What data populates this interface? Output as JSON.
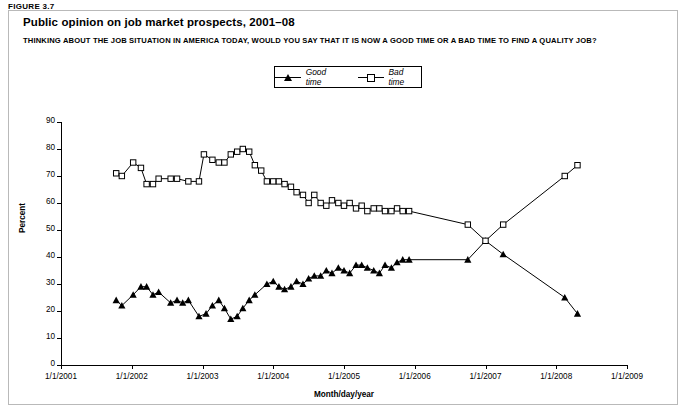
{
  "figure_label": "FIGURE 3.7",
  "title": "Public opinion on job market prospects, 2001–08",
  "subtitle": "THINKING ABOUT THE JOB SITUATION IN AMERICA TODAY, WOULD YOU SAY THAT IT IS NOW A GOOD TIME  OR A BAD TIME TO FIND A QUALITY JOB?",
  "chart_data": {
    "type": "line",
    "title": "Public opinion on job market prospects, 2001–08",
    "xlabel": "Month/day/year",
    "ylabel": "Percent",
    "ylim": [
      0,
      90
    ],
    "yticks": [
      0,
      10,
      20,
      30,
      40,
      50,
      60,
      70,
      80,
      90
    ],
    "xlim": [
      "1/1/2001",
      "1/1/2009"
    ],
    "xticks": [
      "1/1/2001",
      "1/1/2002",
      "1/1/2003",
      "1/1/2004",
      "1/1/2005",
      "1/1/2006",
      "1/1/2007",
      "1/1/2008",
      "1/1/2009"
    ],
    "grid": false,
    "legend_position": "top-center",
    "series": [
      {
        "name": "Good time",
        "marker": "filled-triangle",
        "points": [
          {
            "x": 2001.78,
            "y": 24
          },
          {
            "x": 2001.86,
            "y": 22
          },
          {
            "x": 2002.02,
            "y": 26
          },
          {
            "x": 2002.13,
            "y": 29
          },
          {
            "x": 2002.21,
            "y": 29
          },
          {
            "x": 2002.3,
            "y": 26
          },
          {
            "x": 2002.38,
            "y": 27
          },
          {
            "x": 2002.55,
            "y": 23
          },
          {
            "x": 2002.64,
            "y": 24
          },
          {
            "x": 2002.72,
            "y": 23
          },
          {
            "x": 2002.8,
            "y": 24
          },
          {
            "x": 2002.95,
            "y": 18
          },
          {
            "x": 2003.05,
            "y": 19
          },
          {
            "x": 2003.14,
            "y": 22
          },
          {
            "x": 2003.23,
            "y": 24
          },
          {
            "x": 2003.31,
            "y": 21
          },
          {
            "x": 2003.4,
            "y": 17
          },
          {
            "x": 2003.49,
            "y": 18
          },
          {
            "x": 2003.57,
            "y": 21
          },
          {
            "x": 2003.66,
            "y": 24
          },
          {
            "x": 2003.74,
            "y": 26
          },
          {
            "x": 2003.91,
            "y": 30
          },
          {
            "x": 2004.0,
            "y": 31
          },
          {
            "x": 2004.08,
            "y": 29
          },
          {
            "x": 2004.16,
            "y": 28
          },
          {
            "x": 2004.25,
            "y": 29
          },
          {
            "x": 2004.33,
            "y": 31
          },
          {
            "x": 2004.42,
            "y": 30
          },
          {
            "x": 2004.5,
            "y": 32
          },
          {
            "x": 2004.58,
            "y": 33
          },
          {
            "x": 2004.67,
            "y": 33
          },
          {
            "x": 2004.75,
            "y": 35
          },
          {
            "x": 2004.83,
            "y": 34
          },
          {
            "x": 2004.92,
            "y": 36
          },
          {
            "x": 2005.0,
            "y": 35
          },
          {
            "x": 2005.08,
            "y": 34
          },
          {
            "x": 2005.17,
            "y": 37
          },
          {
            "x": 2005.25,
            "y": 37
          },
          {
            "x": 2005.33,
            "y": 36
          },
          {
            "x": 2005.42,
            "y": 35
          },
          {
            "x": 2005.5,
            "y": 34
          },
          {
            "x": 2005.58,
            "y": 37
          },
          {
            "x": 2005.67,
            "y": 36
          },
          {
            "x": 2005.75,
            "y": 38
          },
          {
            "x": 2005.83,
            "y": 39
          },
          {
            "x": 2005.92,
            "y": 39
          },
          {
            "x": 2006.75,
            "y": 39
          },
          {
            "x": 2007.0,
            "y": 46
          },
          {
            "x": 2007.25,
            "y": 41
          },
          {
            "x": 2008.12,
            "y": 25
          },
          {
            "x": 2008.3,
            "y": 19
          }
        ]
      },
      {
        "name": "Bad time",
        "marker": "open-square",
        "points": [
          {
            "x": 2001.78,
            "y": 71
          },
          {
            "x": 2001.86,
            "y": 70
          },
          {
            "x": 2002.02,
            "y": 75
          },
          {
            "x": 2002.13,
            "y": 73
          },
          {
            "x": 2002.21,
            "y": 67
          },
          {
            "x": 2002.3,
            "y": 67
          },
          {
            "x": 2002.38,
            "y": 69
          },
          {
            "x": 2002.55,
            "y": 69
          },
          {
            "x": 2002.64,
            "y": 69
          },
          {
            "x": 2002.8,
            "y": 68
          },
          {
            "x": 2002.95,
            "y": 68
          },
          {
            "x": 2003.02,
            "y": 78
          },
          {
            "x": 2003.14,
            "y": 76
          },
          {
            "x": 2003.23,
            "y": 75
          },
          {
            "x": 2003.31,
            "y": 75
          },
          {
            "x": 2003.4,
            "y": 78
          },
          {
            "x": 2003.49,
            "y": 79
          },
          {
            "x": 2003.57,
            "y": 80
          },
          {
            "x": 2003.66,
            "y": 79
          },
          {
            "x": 2003.74,
            "y": 74
          },
          {
            "x": 2003.83,
            "y": 72
          },
          {
            "x": 2003.91,
            "y": 68
          },
          {
            "x": 2004.0,
            "y": 68
          },
          {
            "x": 2004.08,
            "y": 68
          },
          {
            "x": 2004.16,
            "y": 67
          },
          {
            "x": 2004.25,
            "y": 66
          },
          {
            "x": 2004.33,
            "y": 64
          },
          {
            "x": 2004.42,
            "y": 63
          },
          {
            "x": 2004.5,
            "y": 60
          },
          {
            "x": 2004.58,
            "y": 63
          },
          {
            "x": 2004.67,
            "y": 60
          },
          {
            "x": 2004.75,
            "y": 59
          },
          {
            "x": 2004.83,
            "y": 61
          },
          {
            "x": 2004.92,
            "y": 60
          },
          {
            "x": 2005.0,
            "y": 59
          },
          {
            "x": 2005.08,
            "y": 60
          },
          {
            "x": 2005.17,
            "y": 58
          },
          {
            "x": 2005.25,
            "y": 59
          },
          {
            "x": 2005.33,
            "y": 57
          },
          {
            "x": 2005.42,
            "y": 58
          },
          {
            "x": 2005.5,
            "y": 58
          },
          {
            "x": 2005.58,
            "y": 57
          },
          {
            "x": 2005.67,
            "y": 57
          },
          {
            "x": 2005.75,
            "y": 58
          },
          {
            "x": 2005.83,
            "y": 57
          },
          {
            "x": 2005.92,
            "y": 57
          },
          {
            "x": 2006.75,
            "y": 52
          },
          {
            "x": 2007.0,
            "y": 46
          },
          {
            "x": 2007.25,
            "y": 52
          },
          {
            "x": 2008.12,
            "y": 70
          },
          {
            "x": 2008.3,
            "y": 74
          }
        ]
      }
    ]
  },
  "legend": {
    "items": [
      {
        "label": "Good time",
        "marker": "filled-triangle"
      },
      {
        "label": "Bad time",
        "marker": "open-square"
      }
    ]
  }
}
